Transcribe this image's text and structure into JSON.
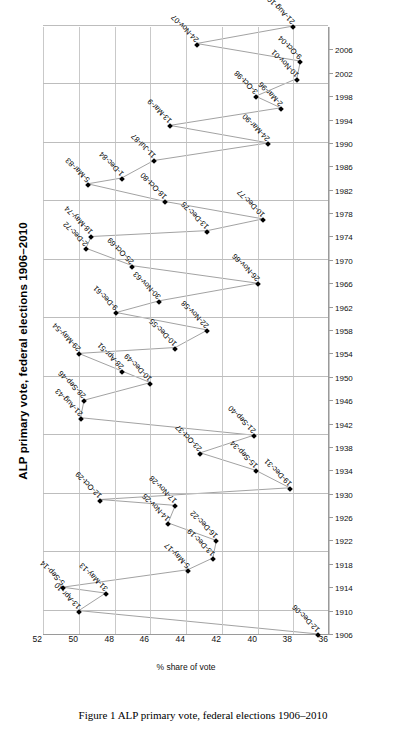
{
  "chart_title": "ALP primary vote, federal elections 1906–2010",
  "caption": "Figure 1  ALP primary vote, federal elections 1906–2010",
  "axes": {
    "ylabel": "% share of vote",
    "xlabel": "",
    "yticks": [
      "36",
      "38",
      "40",
      "42",
      "44",
      "46",
      "48",
      "50",
      "52"
    ],
    "xticks": [
      "1906",
      "1910",
      "1914",
      "1918",
      "1922",
      "1926",
      "1930",
      "1934",
      "1938",
      "1942",
      "1946",
      "1950",
      "1954",
      "1958",
      "1962",
      "1966",
      "1970",
      "1974",
      "1978",
      "1982",
      "1986",
      "1990",
      "1994",
      "1998",
      "2002",
      "2006"
    ]
  },
  "chart_data": {
    "type": "line",
    "title": "ALP primary vote, federal elections 1906–2010",
    "xlabel": "",
    "ylabel": "% share of vote",
    "xlim": [
      1906,
      2010
    ],
    "ylim": [
      36,
      52
    ],
    "grid": true,
    "legend": "none",
    "marker": "diamond",
    "series": [
      {
        "name": "ALP primary vote",
        "points": [
          {
            "label": "12-Dec-06",
            "x": 1906,
            "y": 36.6
          },
          {
            "label": "13-Apr-10",
            "x": 1910,
            "y": 50.0
          },
          {
            "label": "31-May-13",
            "x": 1913,
            "y": 48.5
          },
          {
            "label": "5-Sep-14",
            "x": 1914,
            "y": 50.9
          },
          {
            "label": "5-May-17",
            "x": 1917,
            "y": 43.9
          },
          {
            "label": "13-Dec-19",
            "x": 1919,
            "y": 42.5
          },
          {
            "label": "16-Dec-22",
            "x": 1922,
            "y": 42.3
          },
          {
            "label": "14-Nov-25",
            "x": 1925,
            "y": 45.0
          },
          {
            "label": "17-Nov-28",
            "x": 1928,
            "y": 44.6
          },
          {
            "label": "12-Oct-29",
            "x": 1929,
            "y": 48.8
          },
          {
            "label": "19-Dec-31",
            "x": 1931,
            "y": 38.2
          },
          {
            "label": "15-Sep-34",
            "x": 1934,
            "y": 40.1
          },
          {
            "label": "23-Oct-37",
            "x": 1937,
            "y": 43.2
          },
          {
            "label": "21-Sep-40",
            "x": 1940,
            "y": 40.2
          },
          {
            "label": "21-Aug-43",
            "x": 1943,
            "y": 49.9
          },
          {
            "label": "28-Sep-46",
            "x": 1946,
            "y": 49.7
          },
          {
            "label": "10-Dec-49",
            "x": 1949,
            "y": 46.0
          },
          {
            "label": "28-Apr-51",
            "x": 1951,
            "y": 47.6
          },
          {
            "label": "29-May-54",
            "x": 1954,
            "y": 50.0
          },
          {
            "label": "10-Dec-55",
            "x": 1955,
            "y": 44.6
          },
          {
            "label": "22-Nov-58",
            "x": 1958,
            "y": 42.8
          },
          {
            "label": "9-Dec-61",
            "x": 1961,
            "y": 47.9
          },
          {
            "label": "30-Nov-63",
            "x": 1963,
            "y": 45.5
          },
          {
            "label": "26-Nov-66",
            "x": 1966,
            "y": 40.0
          },
          {
            "label": "25-Oct-69",
            "x": 1969,
            "y": 47.0
          },
          {
            "label": "2-Dec-72",
            "x": 1972,
            "y": 49.6
          },
          {
            "label": "18-May-74",
            "x": 1974,
            "y": 49.3
          },
          {
            "label": "13-Dec-75",
            "x": 1975,
            "y": 42.8
          },
          {
            "label": "10-Dec-77",
            "x": 1977,
            "y": 39.7
          },
          {
            "label": "18-Oct-80",
            "x": 1980,
            "y": 45.2
          },
          {
            "label": "5-Mar-83",
            "x": 1983,
            "y": 49.5
          },
          {
            "label": "1-Dec-84",
            "x": 1984,
            "y": 47.6
          },
          {
            "label": "11-Jul-87",
            "x": 1987,
            "y": 45.8
          },
          {
            "label": "24-Mar-90",
            "x": 1990,
            "y": 39.4
          },
          {
            "label": "13-Mar-9",
            "x": 1993,
            "y": 44.9
          },
          {
            "label": "2-Mar-96",
            "x": 1996,
            "y": 38.7
          },
          {
            "label": "3-Oct-98",
            "x": 1998,
            "y": 40.1
          },
          {
            "label": "10-Nov-01",
            "x": 2001,
            "y": 37.8
          },
          {
            "label": "9-Oct-04",
            "x": 2004,
            "y": 37.6
          },
          {
            "label": "24-Nov-07",
            "x": 2007,
            "y": 43.4
          },
          {
            "label": "21-Aug-10",
            "x": 2010,
            "y": 38.0
          }
        ]
      }
    ]
  }
}
